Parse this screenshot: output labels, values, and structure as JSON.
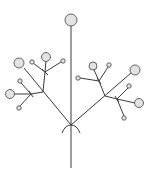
{
  "diagram": {
    "type": "botanical-inflorescence",
    "colors": {
      "line": "#3a3a3a",
      "node_fill": "#e2e2e2",
      "node_stroke": "#555555",
      "background": "#ffffff"
    },
    "stem": {
      "x1": 71,
      "y1": 26,
      "x2": 71,
      "y2": 168
    },
    "main_junction": {
      "x": 71,
      "y": 125
    },
    "edges": [
      {
        "x1": 71,
        "y1": 125,
        "x2": 24,
        "y2": 68
      },
      {
        "x1": 43,
        "y1": 92,
        "x2": 45,
        "y2": 72
      },
      {
        "x1": 45,
        "y1": 72,
        "x2": 46,
        "y2": 61
      },
      {
        "x1": 45,
        "y1": 72,
        "x2": 33,
        "y2": 63
      },
      {
        "x1": 45,
        "y1": 72,
        "x2": 61,
        "y2": 62
      },
      {
        "x1": 43,
        "y1": 92,
        "x2": 31,
        "y2": 94
      },
      {
        "x1": 31,
        "y1": 94,
        "x2": 14,
        "y2": 94
      },
      {
        "x1": 31,
        "y1": 94,
        "x2": 21,
        "y2": 83
      },
      {
        "x1": 31,
        "y1": 94,
        "x2": 20,
        "y2": 106
      },
      {
        "x1": 71,
        "y1": 125,
        "x2": 131,
        "y2": 73
      },
      {
        "x1": 105,
        "y1": 96,
        "x2": 99,
        "y2": 81
      },
      {
        "x1": 99,
        "y1": 81,
        "x2": 94,
        "y2": 70
      },
      {
        "x1": 99,
        "y1": 81,
        "x2": 108,
        "y2": 67
      },
      {
        "x1": 99,
        "y1": 81,
        "x2": 80,
        "y2": 78
      },
      {
        "x1": 105,
        "y1": 96,
        "x2": 117,
        "y2": 99
      },
      {
        "x1": 117,
        "y1": 99,
        "x2": 135,
        "y2": 103
      },
      {
        "x1": 117,
        "y1": 99,
        "x2": 128,
        "y2": 88
      },
      {
        "x1": 117,
        "y1": 99,
        "x2": 124,
        "y2": 116
      }
    ],
    "nodes": [
      {
        "name": "terminal-flower",
        "cx": 71,
        "cy": 20,
        "r": 6
      },
      {
        "name": "left-primary-flower",
        "cx": 19,
        "cy": 63,
        "r": 5
      },
      {
        "name": "left-upper-flower",
        "cx": 46,
        "cy": 57,
        "r": 4.5
      },
      {
        "name": "left-upper-bud-a",
        "cx": 32,
        "cy": 62,
        "r": 2.2
      },
      {
        "name": "left-upper-bud-b",
        "cx": 63,
        "cy": 61,
        "r": 2.2
      },
      {
        "name": "left-lower-flower",
        "cx": 10,
        "cy": 94,
        "r": 4.5
      },
      {
        "name": "left-lower-bud-a",
        "cx": 20,
        "cy": 81,
        "r": 2.2
      },
      {
        "name": "left-lower-bud-b",
        "cx": 19,
        "cy": 108,
        "r": 2.2
      },
      {
        "name": "right-primary-flower",
        "cx": 135,
        "cy": 70,
        "r": 5
      },
      {
        "name": "right-upper-flower",
        "cx": 93,
        "cy": 66,
        "r": 4
      },
      {
        "name": "right-upper-bud-a",
        "cx": 109,
        "cy": 65,
        "r": 2.2
      },
      {
        "name": "right-upper-bud-b",
        "cx": 78,
        "cy": 78,
        "r": 2.2
      },
      {
        "name": "right-lower-flower",
        "cx": 139,
        "cy": 103,
        "r": 4.5
      },
      {
        "name": "right-lower-bud-a",
        "cx": 129,
        "cy": 86,
        "r": 2.2
      },
      {
        "name": "right-lower-bud-b",
        "cx": 124,
        "cy": 118,
        "r": 2.2
      }
    ],
    "bracts": [
      {
        "d": "M62,133 Q65,125 71,125"
      },
      {
        "d": "M80,133 Q77,125 71,125"
      },
      {
        "d": "M42,69 L48,75"
      },
      {
        "d": "M29,91 L33,97"
      },
      {
        "d": "M97,78 L101,84"
      },
      {
        "d": "M115,96 L119,102"
      }
    ]
  }
}
